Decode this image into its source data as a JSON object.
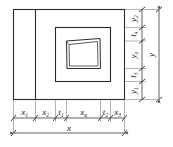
{
  "figure": {
    "type": "engineering-dimension-drawing",
    "line_color": "#2b2b2b",
    "dimension_color": "#3a3a3a",
    "background": "#ffffff"
  },
  "horizontal_chain": {
    "name": "bottom-dimension-chain",
    "segments": [
      {
        "base": "x",
        "sub": "1",
        "label": "x1"
      },
      {
        "base": "x",
        "sub": "2",
        "label": "x2"
      },
      {
        "base": "t",
        "sub": "1",
        "label": "t1"
      },
      {
        "base": "x",
        "sub": "a",
        "label": "xa"
      },
      {
        "base": "t",
        "sub": "2",
        "label": "t2"
      },
      {
        "base": "x",
        "sub": "3",
        "label": "x3"
      }
    ],
    "overall": {
      "base": "x",
      "sub": "",
      "label": "x"
    }
  },
  "vertical_chain": {
    "name": "right-dimension-chain",
    "segments": [
      {
        "base": "y",
        "sub": "2",
        "label": "y2"
      },
      {
        "base": "t",
        "sub": "4",
        "label": "t4"
      },
      {
        "base": "y",
        "sub": "a",
        "label": "ya"
      },
      {
        "base": "t",
        "sub": "3",
        "label": "t3"
      },
      {
        "base": "y",
        "sub": "1",
        "label": "y1"
      }
    ],
    "overall": {
      "base": "y",
      "sub": "",
      "label": "y"
    }
  }
}
